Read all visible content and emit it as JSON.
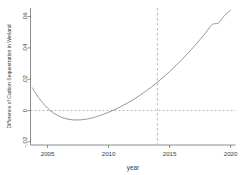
{
  "chart_data": {
    "type": "line",
    "title": "",
    "xlabel": "year",
    "ylabel": "Difference of Carbon Sequestration in Wetland",
    "xlim": [
      2003.6,
      2020.4
    ],
    "ylim": [
      -0.022,
      0.0655
    ],
    "grid": false,
    "legend": null,
    "x_ticks": [
      2005,
      2010,
      2015,
      2020
    ],
    "x_tick_labels": [
      "2005",
      "2010",
      "2015",
      "2020"
    ],
    "y_ticks": [
      -0.02,
      0,
      0.02,
      0.04,
      0.06
    ],
    "y_tick_labels": [
      "-.02",
      "0",
      ".02",
      ".04",
      ".06"
    ],
    "line_color": "#8a8a8a",
    "reference_line_color": "#9a9a9a",
    "hline": {
      "y": 0,
      "style": "dashed"
    },
    "vline": {
      "x": 2014,
      "style": "dashed"
    },
    "series": [
      {
        "name": "Difference of Carbon Sequestration in Wetland",
        "x": [
          2003.75,
          2004.0,
          2004.25,
          2004.5,
          2004.75,
          2005.0,
          2005.25,
          2005.5,
          2005.75,
          2006.0,
          2006.25,
          2006.5,
          2006.75,
          2007.0,
          2007.25,
          2007.5,
          2007.75,
          2008.0,
          2008.25,
          2008.5,
          2008.75,
          2009.0,
          2009.5,
          2010.0,
          2010.5,
          2011.0,
          2011.5,
          2012.0,
          2012.5,
          2013.0,
          2013.5,
          2014.0,
          2014.5,
          2015.0,
          2015.5,
          2016.0,
          2016.5,
          2017.0,
          2017.5,
          2018.0,
          2018.5,
          2019.0,
          2019.5,
          2020.0
        ],
        "y": [
          0.0145,
          0.0113,
          0.0084,
          0.0058,
          0.0035,
          0.0015,
          -0.0002,
          -0.0016,
          -0.0028,
          -0.0038,
          -0.0046,
          -0.0052,
          -0.0056,
          -0.0059,
          -0.006,
          -0.006,
          -0.0059,
          -0.0057,
          -0.0054,
          -0.005,
          -0.0045,
          -0.0039,
          -0.0026,
          -0.0011,
          0.0006,
          0.0025,
          0.0046,
          0.0069,
          0.0094,
          0.0121,
          0.015,
          0.0181,
          0.0214,
          0.0249,
          0.0286,
          0.0325,
          0.0366,
          0.0409,
          0.0454,
          0.0501,
          0.055,
          0.0559,
          0.0607,
          0.0642
        ]
      }
    ]
  },
  "axis": {
    "x_title": "year",
    "y_title": "Difference of Carbon Sequestration in Wetland"
  }
}
